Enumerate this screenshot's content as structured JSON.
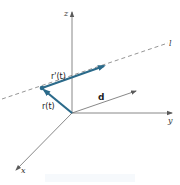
{
  "figure": {
    "axes": {
      "z_label": "z",
      "y_label": "y",
      "x_label": "x"
    },
    "line_label": "l",
    "vectors": {
      "r_label": "r(t)",
      "r_prime_label": "r'(t)",
      "d_label": "d"
    },
    "colors": {
      "vector": "#2b6a8a",
      "axis": "#6a6a6a",
      "dashed_line": "#7a7a7a"
    }
  }
}
